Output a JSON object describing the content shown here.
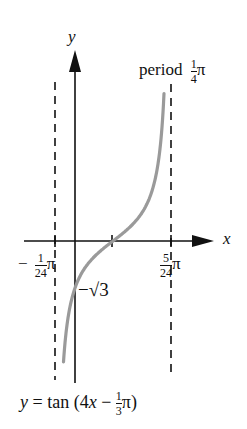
{
  "figure": {
    "y_axis_label": "y",
    "x_axis_label": "x",
    "period_label": "period",
    "period_value": {
      "num": "1",
      "den": "4",
      "suffix": "π"
    },
    "left_asymptote_label": {
      "sign": "−",
      "num": "1",
      "den": "24",
      "suffix": "π"
    },
    "right_asymptote_label": {
      "num": "5",
      "den": "24",
      "suffix": "π"
    },
    "y_intercept_label": "−√3",
    "equation": {
      "prefix": "y = tan (4",
      "var": "x",
      "mid": " − ",
      "num": "1",
      "den": "3",
      "suffix": "π)"
    }
  },
  "colors": {
    "axis": "#111111",
    "curve": "#9a9a9a",
    "asymptote": "#111111"
  },
  "curve": {
    "function": "tan(4x - pi/3)",
    "left_asymptote": "-pi/24",
    "right_asymptote": "5pi/24",
    "zero": "pi/12",
    "y_intercept": "-sqrt(3)"
  }
}
